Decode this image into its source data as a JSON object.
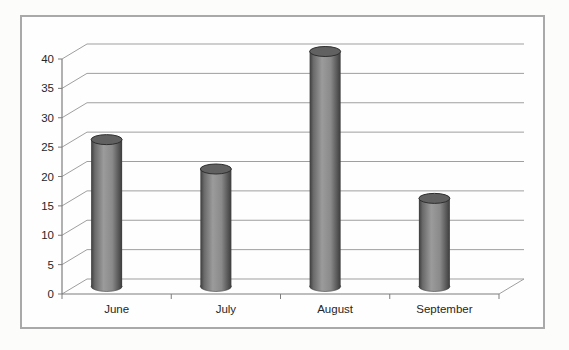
{
  "chart_data": {
    "type": "bar",
    "subtype": "3d-cylinder",
    "title": "",
    "xlabel": "",
    "ylabel": "",
    "categories": [
      "June",
      "July",
      "August",
      "September"
    ],
    "values": [
      25,
      20,
      40,
      15
    ],
    "ylim": [
      0,
      40
    ],
    "y_ticks": [
      0,
      5,
      10,
      15,
      20,
      25,
      30,
      35,
      40
    ],
    "grid": true,
    "legend": false
  },
  "style": {
    "page_background": "#fcfcfa",
    "plot_background": "#fefefe",
    "frame_border_color": "#a9a9a9",
    "gridline_color": "#9f9f9f",
    "axis_color": "#7d7d7d",
    "text_color": "#262626",
    "bar_edge_color": "#3c3c3c",
    "bar_mid_color": "#9b9b9b",
    "bar_shoulder_color": "#6a6a6a",
    "bar_fade_color": "#8a8a8a",
    "bar_top_color": "#616161",
    "bar_top_stroke": "#2e2e2e"
  }
}
